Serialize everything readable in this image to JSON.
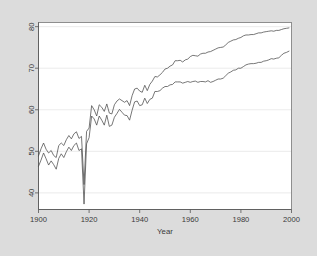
{
  "figure": {
    "background_color": "#dcdcdc",
    "plot_background_color": "#ffffff",
    "frame_color": "#777777",
    "line_color": "#4a4a4a",
    "grid_color": "#e2e2e2"
  },
  "chart_data": {
    "type": "line",
    "title": "",
    "xlabel": "Year",
    "ylabel": "",
    "xlim": [
      1900,
      2000
    ],
    "ylim": [
      36,
      81
    ],
    "xticks": [
      1900,
      1920,
      1940,
      1960,
      1980,
      2000
    ],
    "xtick_labels": [
      "1900",
      "1920",
      "1940",
      "1960",
      "1980",
      "2000"
    ],
    "yticks": [
      40,
      50,
      60,
      70,
      80
    ],
    "ytick_labels": [
      "40",
      "50",
      "60",
      "70",
      "80"
    ],
    "grid": true,
    "grid_axis": "y",
    "legend": "none",
    "ytick_label_rotation": 90,
    "x": [
      1900,
      1901,
      1902,
      1903,
      1904,
      1905,
      1906,
      1907,
      1908,
      1909,
      1910,
      1911,
      1912,
      1913,
      1914,
      1915,
      1916,
      1917,
      1918,
      1919,
      1920,
      1921,
      1922,
      1923,
      1924,
      1925,
      1926,
      1927,
      1928,
      1929,
      1930,
      1931,
      1932,
      1933,
      1934,
      1935,
      1936,
      1937,
      1938,
      1939,
      1940,
      1941,
      1942,
      1943,
      1944,
      1945,
      1946,
      1947,
      1948,
      1949,
      1950,
      1951,
      1952,
      1953,
      1954,
      1955,
      1956,
      1957,
      1958,
      1959,
      1960,
      1961,
      1962,
      1963,
      1964,
      1965,
      1966,
      1967,
      1968,
      1969,
      1970,
      1971,
      1972,
      1973,
      1974,
      1975,
      1976,
      1977,
      1978,
      1979,
      1980,
      1981,
      1982,
      1983,
      1984,
      1985,
      1986,
      1987,
      1988,
      1989,
      1990,
      1991,
      1992,
      1993,
      1994,
      1995,
      1996,
      1997,
      1998,
      1999
    ],
    "series": [
      {
        "name": "upper",
        "values": [
          48.9,
          50.6,
          52.0,
          50.5,
          49.6,
          50.2,
          49.0,
          48.5,
          51.4,
          52.0,
          51.4,
          52.8,
          53.8,
          53.0,
          54.2,
          54.7,
          53.1,
          53.6,
          42.0,
          54.8,
          55.6,
          61.0,
          60.0,
          58.5,
          61.2,
          60.6,
          59.6,
          61.4,
          59.2,
          59.0,
          61.2,
          62.1,
          62.6,
          62.2,
          61.8,
          62.2,
          61.0,
          63.4,
          65.0,
          65.2,
          64.5,
          64.2,
          65.9,
          64.6,
          66.1,
          66.9,
          68.0,
          67.9,
          68.4,
          69.0,
          69.8,
          70.0,
          70.5,
          70.8,
          71.8,
          71.8,
          71.9,
          71.5,
          72.0,
          72.2,
          72.8,
          73.1,
          73.0,
          72.9,
          73.4,
          73.6,
          73.6,
          73.9,
          74.0,
          74.3,
          74.6,
          74.9,
          75.0,
          75.1,
          75.6,
          76.2,
          76.5,
          76.8,
          76.9,
          77.2,
          77.4,
          77.8,
          78.0,
          78.0,
          78.1,
          78.1,
          78.3,
          78.5,
          78.5,
          78.7,
          78.8,
          78.9,
          79.0,
          78.9,
          79.1,
          79.1,
          79.3,
          79.5,
          79.6,
          79.7
        ]
      },
      {
        "name": "lower",
        "values": [
          46.4,
          47.9,
          49.6,
          48.2,
          46.7,
          47.7,
          46.8,
          45.7,
          48.3,
          49.4,
          48.5,
          49.9,
          51.0,
          50.2,
          51.4,
          52.0,
          50.2,
          50.6,
          37.3,
          51.8,
          53.3,
          58.5,
          57.8,
          56.3,
          58.5,
          57.5,
          56.3,
          58.7,
          56.0,
          56.3,
          58.2,
          59.1,
          60.1,
          59.4,
          58.7,
          58.6,
          57.5,
          59.9,
          61.9,
          62.1,
          61.0,
          61.2,
          62.8,
          61.5,
          62.5,
          62.8,
          64.4,
          64.4,
          64.6,
          65.2,
          65.6,
          65.6,
          66.0,
          66.1,
          66.7,
          66.7,
          66.7,
          66.4,
          66.6,
          66.8,
          66.6,
          66.8,
          66.9,
          66.6,
          66.8,
          66.8,
          66.7,
          67.0,
          66.6,
          66.8,
          67.1,
          67.4,
          67.4,
          67.6,
          68.2,
          68.8,
          69.1,
          69.5,
          69.6,
          70.0,
          70.0,
          70.4,
          70.8,
          71.0,
          71.1,
          71.1,
          71.2,
          71.4,
          71.4,
          71.7,
          71.8,
          72.0,
          72.3,
          72.2,
          72.4,
          72.5,
          73.1,
          73.6,
          73.8,
          74.1
        ]
      }
    ]
  }
}
